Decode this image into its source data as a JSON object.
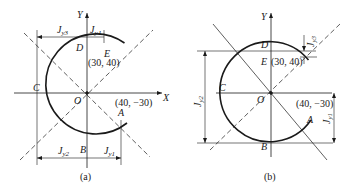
{
  "figure": {
    "panels": [
      {
        "id": "a",
        "caption": "(a)",
        "axes": {
          "x_label": "X",
          "y_label": "Y",
          "origin_label": "O"
        },
        "points": {
          "A": {
            "label": "A",
            "coords": "(40, −30)"
          },
          "B": {
            "label": "B"
          },
          "C": {
            "label": "C"
          },
          "D": {
            "label": "D"
          },
          "E": {
            "label": "E",
            "coords": "(30, 40)"
          }
        },
        "dimensions": [
          {
            "main": "J",
            "sub": "y3"
          },
          {
            "main": "J",
            "sub": "y4"
          },
          {
            "main": "J",
            "sub": "y2"
          },
          {
            "main": "J",
            "sub": "y1"
          }
        ]
      },
      {
        "id": "b",
        "caption": "(b)",
        "axes": {
          "y_label": "Y",
          "origin_label": "O"
        },
        "points": {
          "A": {
            "label": "A",
            "coords": "(40, −30)"
          },
          "B": {
            "label": "B"
          },
          "C": {
            "label": "C"
          },
          "D": {
            "label": "D"
          },
          "E": {
            "label": "E",
            "coords": "(30, 40)"
          }
        },
        "dimensions": [
          {
            "main": "J",
            "sub": "y3"
          },
          {
            "main": "J",
            "sub": "y2"
          },
          {
            "main": "J",
            "sub": "y1"
          }
        ]
      }
    ]
  }
}
